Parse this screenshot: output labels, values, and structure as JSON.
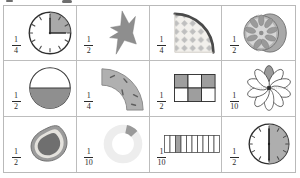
{
  "document": {
    "title": "Fractions of shapes and objects worksheet",
    "kind": "fraction-illustration-grid",
    "rows": 3,
    "columns": 4
  },
  "palette": {
    "shade": "#8f8f8f",
    "shade_light": "#c9c9c9",
    "outline": "#3a3a3a",
    "grid_line": "#bdbdbd",
    "text": "#2b2b2b",
    "white": "#ffffff"
  },
  "cells": [
    {
      "id": "cell-1-1",
      "icon": "clock-quarter-shaded-icon",
      "description": "Analog clock face with the quarter from 12 to 3 shaded",
      "fraction": {
        "numerator": "1",
        "denominator": "4"
      },
      "shaded_parts": 1,
      "total_parts": 4
    },
    {
      "id": "cell-1-2",
      "icon": "half-star-icon",
      "description": "Four-point star with the right half shaded",
      "fraction": {
        "numerator": "1",
        "denominator": "2"
      },
      "shaded_parts": 1,
      "total_parts": 2
    },
    {
      "id": "cell-1-3",
      "icon": "quarter-circle-patterned-icon",
      "description": "Quarter circle wedge with diamond lattice pattern",
      "fraction": {
        "numerator": "1",
        "denominator": "4"
      },
      "shaded_parts": 1,
      "total_parts": 4
    },
    {
      "id": "cell-1-4",
      "icon": "half-citrus-slice-icon",
      "description": "Citrus fruit cut in half showing segments",
      "fraction": {
        "numerator": "1",
        "denominator": "2"
      },
      "shaded_parts": 1,
      "total_parts": 2
    },
    {
      "id": "cell-2-1",
      "icon": "circle-bottom-half-shaded-icon",
      "description": "Circle with the bottom half shaded",
      "fraction": {
        "numerator": "1",
        "denominator": "2"
      },
      "shaded_parts": 1,
      "total_parts": 2
    },
    {
      "id": "cell-2-2",
      "icon": "quarter-annulus-road-icon",
      "description": "Quarter ring curved road band with dashes",
      "fraction": {
        "numerator": "1",
        "denominator": "4"
      },
      "shaded_parts": 1,
      "total_parts": 4
    },
    {
      "id": "cell-2-3",
      "icon": "grid-3x2-half-shaded-icon",
      "description": "Rectangle divided into six squares, three shaded in a checker pattern",
      "fraction": {
        "numerator": "1",
        "denominator": "2"
      },
      "shaded_parts": 3,
      "total_parts": 6
    },
    {
      "id": "cell-2-4",
      "icon": "flower-ten-petals-icon",
      "description": "Flower with ten petals, one petal shaded",
      "fraction": {
        "numerator": "1",
        "denominator": "10"
      },
      "shaded_parts": 1,
      "total_parts": 10
    },
    {
      "id": "cell-3-1",
      "icon": "avocado-half-icon",
      "description": "Avocado cut in half showing the stone",
      "fraction": {
        "numerator": "1",
        "denominator": "2"
      },
      "shaded_parts": 1,
      "total_parts": 2
    },
    {
      "id": "cell-3-2",
      "icon": "donut-ring-tenth-shaded-icon",
      "description": "Ring / donut chart with one tenth shaded at the top right",
      "fraction": {
        "numerator": "1",
        "denominator": "10"
      },
      "shaded_parts": 1,
      "total_parts": 10
    },
    {
      "id": "cell-3-3",
      "icon": "bar-ten-segments-icon",
      "description": "Horizontal bar divided into ten equal segments with the third shaded",
      "fraction": {
        "numerator": "1",
        "denominator": "10"
      },
      "shaded_parts": 1,
      "total_parts": 10
    },
    {
      "id": "cell-3-4",
      "icon": "clock-right-half-shaded-icon",
      "description": "Analog clock face with the right half shaded",
      "fraction": {
        "numerator": "1",
        "denominator": "2"
      },
      "shaded_parts": 1,
      "total_parts": 2
    }
  ]
}
